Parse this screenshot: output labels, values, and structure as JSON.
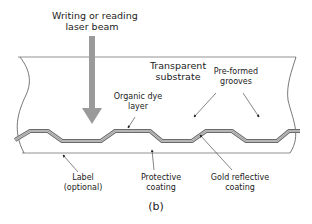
{
  "figure": {
    "caption": "(b)",
    "colors": {
      "line": "#555555",
      "arrow": "#9a9a9a",
      "layer_dark": "#666666",
      "layer_light": "#bdbdbd",
      "text": "#222222"
    }
  },
  "labels": {
    "laser_beam": {
      "line1": "Writing or reading",
      "line2": "laser beam"
    },
    "transparent_substrate": {
      "line1": "Transparent",
      "line2": "substrate"
    },
    "organic_dye_layer": {
      "line1": "Organic dye",
      "line2": "layer"
    },
    "pre_formed_grooves": {
      "line1": "Pre-formed",
      "line2": "grooves"
    },
    "label_optional": {
      "line1": "Label",
      "line2": "(optional)"
    },
    "protective_coating": {
      "line1": "Protective",
      "line2": "coating"
    },
    "gold_reflective_coating": {
      "line1": "Gold reflective",
      "line2": "coating"
    }
  }
}
